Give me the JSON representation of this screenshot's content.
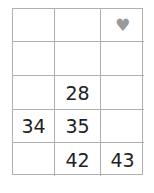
{
  "grid": {
    "rows": 5,
    "cols": 3,
    "cells": [
      [
        "",
        "",
        "♥"
      ],
      [
        "",
        "",
        ""
      ],
      [
        "",
        "28",
        ""
      ],
      [
        "34",
        "35",
        ""
      ],
      [
        "",
        "42",
        "43"
      ]
    ]
  },
  "icons": {
    "heart": "♥"
  }
}
